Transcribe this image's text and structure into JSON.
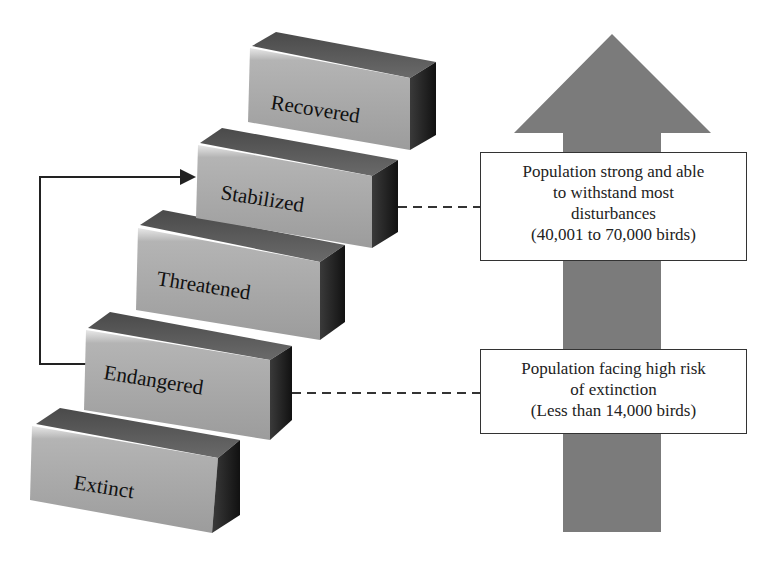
{
  "diagram": {
    "steps": [
      {
        "id": "extinct",
        "label": "Extinct",
        "order": 1
      },
      {
        "id": "endangered",
        "label": "Endangered",
        "order": 2
      },
      {
        "id": "threatened",
        "label": "Threatened",
        "order": 3
      },
      {
        "id": "stabilized",
        "label": "Stabilized",
        "order": 4
      },
      {
        "id": "recovered",
        "label": "Recovered",
        "order": 5
      }
    ],
    "connector_arrow": {
      "from": "endangered",
      "to": "stabilized"
    },
    "upward_arrow": {
      "color": "#7a7a7a",
      "direction": "up"
    },
    "callouts": [
      {
        "id": "stabilized-callout",
        "attached_to": "stabilized",
        "lines": [
          "Population strong  and able",
          "to withstand most",
          "disturbances",
          "(40,001 to 70,000 birds)"
        ]
      },
      {
        "id": "endangered-callout",
        "attached_to": "endangered",
        "lines": [
          "Population facing high risk",
          "of extinction",
          "(Less than 14,000 birds)"
        ]
      }
    ],
    "colors": {
      "step_front": "#a9a9a9",
      "step_top": "#5a5a5a",
      "step_side": "#1e1e1e",
      "arrow": "#7a7a7a",
      "line": "#222222"
    }
  }
}
